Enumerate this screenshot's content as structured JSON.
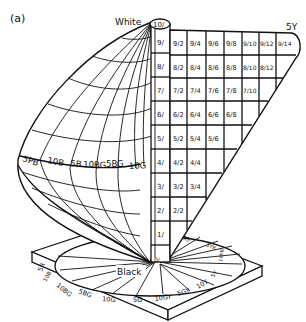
{
  "panel_label": "(a)",
  "pole_labels": {
    "white": "White",
    "black": "Black"
  },
  "hue_label_top_right": "5Y",
  "value_axis": [
    "10/",
    "9/",
    "8/",
    "7/",
    "6/",
    "5/",
    "4/",
    "3/",
    "2/",
    "1/",
    "0/"
  ],
  "chroma_rows": [
    {
      "value": "9/",
      "cells": [
        "9/2",
        "9/4",
        "9/6",
        "9/8",
        "9/10",
        "9/12",
        "9/14"
      ]
    },
    {
      "value": "8/",
      "cells": [
        "8/2",
        "8/4",
        "8/6",
        "8/8",
        "8/10",
        "8/12"
      ]
    },
    {
      "value": "7/",
      "cells": [
        "7/2",
        "7/4",
        "7/6",
        "7/8",
        "7/10"
      ]
    },
    {
      "value": "6/",
      "cells": [
        "6/2",
        "6/4",
        "6/6",
        "6/8"
      ]
    },
    {
      "value": "5/",
      "cells": [
        "5/2",
        "5/4",
        "5/6"
      ]
    },
    {
      "value": "4/",
      "cells": [
        "4/2",
        "4/4"
      ]
    },
    {
      "value": "3/",
      "cells": [
        "3/2",
        "3/4"
      ]
    },
    {
      "value": "2/",
      "cells": [
        "2/2"
      ]
    }
  ],
  "left_lobe_hues": [
    "5PB",
    "10B",
    "5B",
    "10BG",
    "5BG",
    "10G"
  ],
  "base_hues": [
    "5PB",
    "10B",
    "5B",
    "10BG",
    "5BG",
    "10G",
    "5G",
    "10GY",
    "5GY",
    "10Y",
    "5Y",
    "10YR",
    "5YR",
    "10R",
    "5R"
  ],
  "base_hue_labels_visible": {
    "left": [
      "5R",
      "10B",
      "5B"
    ],
    "bottom": [
      "10BG",
      "5BG",
      "10G",
      "5G",
      "10GY",
      "5GY",
      "10Y"
    ],
    "right": [
      "5Y",
      "10YR",
      "5YR",
      "R5"
    ]
  },
  "colors": {
    "ink": "#111111",
    "background": "#ffffff"
  }
}
